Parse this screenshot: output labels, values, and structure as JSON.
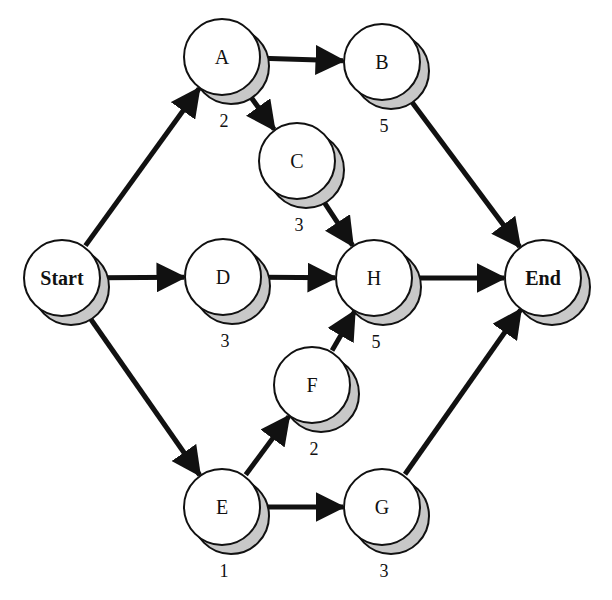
{
  "diagram": {
    "type": "activity-network",
    "colors": {
      "edge": "#111111",
      "node_fill": "#ffffff",
      "node_stroke": "#111111",
      "shadow": "#c8c8c8"
    },
    "node_radius": 38,
    "shadow_offset": [
      10,
      10
    ],
    "nodes": [
      {
        "id": "start",
        "label": "Start",
        "duration": "",
        "x": 62,
        "y": 278
      },
      {
        "id": "a",
        "label": "A",
        "duration": "2",
        "x": 222,
        "y": 57
      },
      {
        "id": "b",
        "label": "B",
        "duration": "5",
        "x": 382,
        "y": 62
      },
      {
        "id": "c",
        "label": "C",
        "duration": "3",
        "x": 297,
        "y": 161
      },
      {
        "id": "d",
        "label": "D",
        "duration": "3",
        "x": 223,
        "y": 277
      },
      {
        "id": "h",
        "label": "H",
        "duration": "5",
        "x": 374,
        "y": 278
      },
      {
        "id": "end",
        "label": "End",
        "duration": "",
        "x": 543,
        "y": 278
      },
      {
        "id": "f",
        "label": "F",
        "duration": "2",
        "x": 312,
        "y": 385
      },
      {
        "id": "e",
        "label": "E",
        "duration": "1",
        "x": 222,
        "y": 507
      },
      {
        "id": "g",
        "label": "G",
        "duration": "3",
        "x": 382,
        "y": 507
      }
    ],
    "edges": [
      {
        "from": "start",
        "to": "a"
      },
      {
        "from": "start",
        "to": "d"
      },
      {
        "from": "start",
        "to": "e"
      },
      {
        "from": "a",
        "to": "b"
      },
      {
        "from": "a",
        "to": "c"
      },
      {
        "from": "b",
        "to": "end"
      },
      {
        "from": "c",
        "to": "h"
      },
      {
        "from": "d",
        "to": "h"
      },
      {
        "from": "h",
        "to": "end"
      },
      {
        "from": "e",
        "to": "f"
      },
      {
        "from": "e",
        "to": "g"
      },
      {
        "from": "f",
        "to": "h"
      },
      {
        "from": "g",
        "to": "end"
      }
    ]
  }
}
